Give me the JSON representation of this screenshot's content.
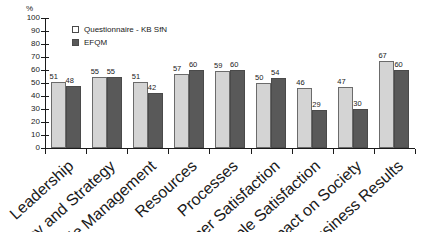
{
  "chart_data": {
    "type": "bar",
    "title": "",
    "xlabel": "",
    "ylabel": "%",
    "ylim": [
      0,
      100
    ],
    "ytick_step": 10,
    "yticks": [
      0,
      10,
      20,
      30,
      40,
      50,
      60,
      70,
      80,
      90,
      100
    ],
    "grid": false,
    "legend_position": "top-left-inside",
    "categories": [
      "Leadership",
      "Policy and Strategy",
      "People Management",
      "Resources",
      "Processes",
      "Customer Satisfaction",
      "People Satisfaction",
      "Impact on Society",
      "Business Results"
    ],
    "series": [
      {
        "name": "Questionnaire - KB SfN",
        "color": "#d4d4d4",
        "values": [
          51,
          55,
          51,
          57,
          59,
          50,
          46,
          47,
          67
        ]
      },
      {
        "name": "EFQM",
        "color": "#595959",
        "values": [
          48,
          55,
          42,
          60,
          60,
          54,
          29,
          30,
          60
        ]
      }
    ]
  },
  "axis": {
    "unit_label": "%"
  },
  "legend": {
    "items": [
      {
        "label": "Questionnaire - KB SfN",
        "swatch": "light"
      },
      {
        "label": "EFQM",
        "swatch": "dark"
      }
    ]
  }
}
